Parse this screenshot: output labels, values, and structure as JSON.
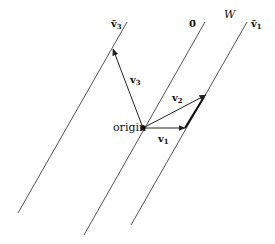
{
  "diagram": {
    "type": "affine-subspaces-cosets",
    "colors": {
      "line": "#555555",
      "vector": "#222222",
      "background": "#ffffff"
    },
    "lines": [
      {
        "id": "v3bar",
        "label": "v̄",
        "label_sub": "3",
        "x1": 127,
        "y1": 22,
        "x2": 18,
        "y2": 213
      },
      {
        "id": "zerobar",
        "label": "0̄",
        "x1": 205,
        "y1": 22,
        "x2": 84,
        "y2": 235
      },
      {
        "id": "v1bar",
        "label": "v̄",
        "label_sub": "1",
        "x1": 247,
        "y1": 22,
        "x2": 131,
        "y2": 225
      }
    ],
    "subspace_label": "W",
    "origin": {
      "label": "origin",
      "x": 143,
      "y": 128
    },
    "vectors": [
      {
        "id": "v1",
        "label": "v",
        "sub": "1",
        "x2": 185,
        "y2": 128
      },
      {
        "id": "v2",
        "label": "v",
        "sub": "2",
        "x2": 206,
        "y2": 95
      },
      {
        "id": "v3",
        "label": "v",
        "sub": "3",
        "x2": 113,
        "y2": 49
      }
    ]
  }
}
